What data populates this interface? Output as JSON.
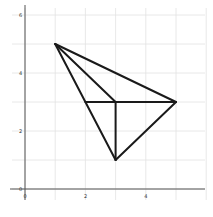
{
  "axes": {
    "x_ticks": [
      {
        "value": 0,
        "label": "0"
      },
      {
        "value": 2,
        "label": "2"
      },
      {
        "value": 4,
        "label": "4"
      }
    ],
    "y_ticks": [
      {
        "value": 2,
        "label": "2"
      },
      {
        "value": 4,
        "label": "4"
      },
      {
        "value": 6,
        "label": "6"
      }
    ],
    "origin_label": "0",
    "grid_step": 1,
    "xlim": [
      0,
      6
    ],
    "ylim": [
      0,
      6
    ]
  },
  "points": [
    {
      "name": "A",
      "x": 1,
      "y": 5
    },
    {
      "name": "B",
      "x": 5,
      "y": 3
    },
    {
      "name": "C",
      "x": 3,
      "y": 1
    },
    {
      "name": "D",
      "x": 3,
      "y": 3
    },
    {
      "name": "E",
      "x": 2,
      "y": 3
    }
  ],
  "segments": [
    [
      "A",
      "B"
    ],
    [
      "A",
      "C"
    ],
    [
      "A",
      "D"
    ],
    [
      "B",
      "C"
    ],
    [
      "E",
      "B"
    ],
    [
      "D",
      "C"
    ]
  ],
  "colors": {
    "line": "#1a1a1a",
    "grid": "#e2e2e2",
    "axis": "#555555"
  }
}
